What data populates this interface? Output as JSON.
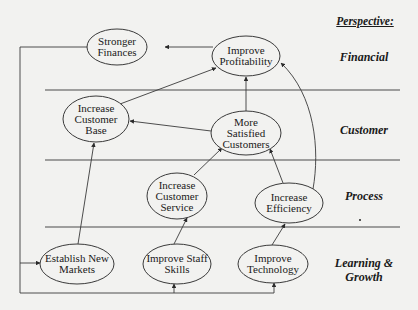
{
  "diagram": {
    "type": "strategy-map",
    "perspective_header": "Perspective:",
    "perspectives": [
      {
        "id": "financial",
        "label": "Financial"
      },
      {
        "id": "customer",
        "label": "Customer"
      },
      {
        "id": "process",
        "label": "Process"
      },
      {
        "id": "learning",
        "label_line1": "Learning &",
        "label_line2": "Growth"
      }
    ],
    "nodes": {
      "stronger_finances": {
        "line1": "Stronger",
        "line2": "Finances"
      },
      "improve_profitability": {
        "line1": "Improve",
        "line2": "Profitability"
      },
      "increase_customer_base": {
        "line1": "Increase",
        "line2": "Customer",
        "line3": "Base"
      },
      "more_satisfied_customers": {
        "line1": "More",
        "line2": "Satisfied",
        "line3": "Customers"
      },
      "increase_customer_service": {
        "line1": "Increase",
        "line2": "Customer",
        "line3": "Service"
      },
      "increase_efficiency": {
        "line1": "Increase",
        "line2": "Efficiency"
      },
      "establish_new_markets": {
        "line1": "Establish New",
        "line2": "Markets"
      },
      "improve_staff_skills": {
        "line1": "Improve Staff",
        "line2": "Skills"
      },
      "improve_technology": {
        "line1": "Improve",
        "line2": "Technology"
      }
    },
    "edges": [
      {
        "from": "improve_profitability",
        "to": "stronger_finances"
      },
      {
        "from": "increase_customer_base",
        "to": "improve_profitability"
      },
      {
        "from": "more_satisfied_customers",
        "to": "improve_profitability"
      },
      {
        "from": "more_satisfied_customers",
        "to": "increase_customer_base"
      },
      {
        "from": "increase_customer_service",
        "to": "more_satisfied_customers"
      },
      {
        "from": "increase_efficiency",
        "to": "more_satisfied_customers"
      },
      {
        "from": "increase_efficiency",
        "to": "improve_profitability"
      },
      {
        "from": "establish_new_markets",
        "to": "increase_customer_base"
      },
      {
        "from": "improve_staff_skills",
        "to": "increase_customer_service"
      },
      {
        "from": "improve_technology",
        "to": "increase_efficiency"
      },
      {
        "from": "bottom_bus",
        "to": "establish_new_markets"
      },
      {
        "from": "bottom_bus",
        "to": "improve_staff_skills"
      },
      {
        "from": "bottom_bus",
        "to": "improve_technology"
      },
      {
        "from": "left_bus",
        "to": "stronger_finances"
      }
    ],
    "colors": {
      "background": "#f2f2f0",
      "line": "#3a3a3a",
      "node_fill": "#f2f2f0",
      "text": "#1a1a1a"
    }
  }
}
